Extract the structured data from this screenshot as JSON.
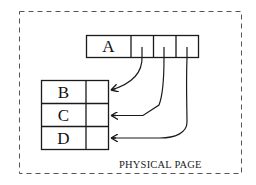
{
  "diagram": {
    "frame": {
      "label": "PHYSICAL PAGE",
      "style": "dashed",
      "color": "#555555"
    },
    "record_a": {
      "label": "A",
      "pointer_slot_count": 3
    },
    "record_table": {
      "rows": [
        {
          "label": "B"
        },
        {
          "label": "C"
        },
        {
          "label": "D"
        }
      ]
    },
    "pointers": [
      {
        "from": "A.slot1",
        "to": "B"
      },
      {
        "from": "A.slot2",
        "to": "C"
      },
      {
        "from": "A.slot3",
        "to": "D"
      }
    ],
    "colors": {
      "stroke": "#1a1a1a",
      "background": "#ffffff"
    }
  }
}
